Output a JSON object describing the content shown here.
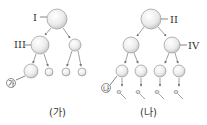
{
  "diagram": {
    "left": {
      "caption": "(가)",
      "labels": {
        "top": "I",
        "mid": "III",
        "cell": "㉮"
      }
    },
    "right": {
      "caption": "(나)",
      "labels": {
        "top": "II",
        "mid": "IV",
        "cell": "㉯"
      }
    }
  }
}
